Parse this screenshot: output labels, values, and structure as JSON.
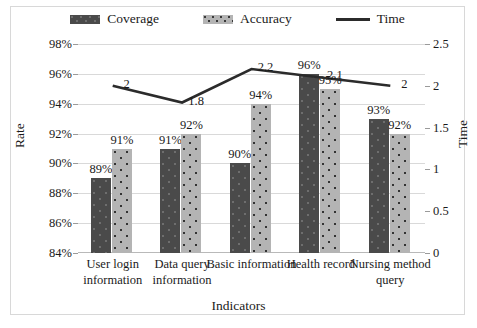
{
  "legend": {
    "items": [
      {
        "name": "coverage",
        "label": "Coverage",
        "style": "bar-dark"
      },
      {
        "name": "accuracy",
        "label": "Accuracy",
        "style": "bar-light"
      },
      {
        "name": "time",
        "label": "Time",
        "style": "line"
      }
    ]
  },
  "axes": {
    "left_label": "Rate",
    "right_label": "Time",
    "x_label": "Indicators",
    "left_ticks": [
      "84%",
      "86%",
      "88%",
      "90%",
      "92%",
      "94%",
      "96%",
      "98%"
    ],
    "right_ticks": [
      "0",
      "0.5",
      "1",
      "1.5",
      "2",
      "2.5"
    ]
  },
  "colors": {
    "coverage": "#4a4a4a",
    "accuracy": "#b4b4b4",
    "time_line": "#2b2b2b",
    "grid": "#d9d9d9",
    "frame": "#d8d8d8"
  },
  "chart_data": {
    "type": "bar",
    "title": "",
    "xlabel": "Indicators",
    "ylabel": "Rate",
    "y2label": "Time",
    "ylim": [
      84,
      98
    ],
    "y2lim": [
      0,
      2.5
    ],
    "grid": true,
    "legend_position": "top",
    "categories": [
      "User login information",
      "Data query information",
      "Basic information",
      "Health record",
      "Nursing method query"
    ],
    "series": [
      {
        "name": "Coverage",
        "type": "bar",
        "axis": "left",
        "values": [
          89,
          91,
          90,
          96,
          93
        ],
        "labels": [
          "89%",
          "91%",
          "90%",
          "96%",
          "93%"
        ]
      },
      {
        "name": "Accuracy",
        "type": "bar",
        "axis": "left",
        "values": [
          91,
          92,
          94,
          95,
          92
        ],
        "labels": [
          "91%",
          "92%",
          "94%",
          "95%",
          "92%"
        ]
      },
      {
        "name": "Time",
        "type": "line",
        "axis": "right",
        "values": [
          2,
          1.8,
          2.2,
          2.1,
          2
        ],
        "labels": [
          "2",
          "1.8",
          "2.2",
          "2.1",
          "2"
        ]
      }
    ]
  }
}
